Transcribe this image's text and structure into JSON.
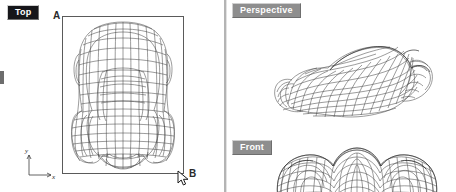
{
  "app": {
    "type": "3d-cad-viewport-layout",
    "background_color": "#ffffff"
  },
  "viewports": [
    {
      "id": "top",
      "label": "Top",
      "state": "active",
      "label_bg": "#16161a",
      "label_color": "#ffffff",
      "axes": [
        "y",
        "x"
      ],
      "corner_markers": [
        "A",
        "B"
      ],
      "model": "car-wireframe-top-plan"
    },
    {
      "id": "perspective",
      "label": "Perspective",
      "state": "inactive",
      "label_bg": "#8e8e8e",
      "label_color": "#ffffff",
      "axes": [
        "z",
        "y",
        "x"
      ],
      "model": "car-wireframe-perspective"
    },
    {
      "id": "front",
      "label": "Front",
      "state": "inactive",
      "label_bg": "#8e8e8e",
      "label_color": "#ffffff",
      "axes": [],
      "model": "car-wireframe-front-elevation"
    }
  ],
  "annotations": {
    "letter_a": "A",
    "letter_b": "B"
  },
  "gnomon_top": {
    "y_label": "y",
    "x_label": "x"
  },
  "gnomon_perspective": {
    "z_label": "z",
    "y_label": "y",
    "x_label": "x"
  },
  "cursor": {
    "name": "arrow-pointer",
    "x": 177,
    "y": 170
  },
  "colors": {
    "wire": "#4a4a4a",
    "frame": "#5a5a5a",
    "divider": "#b4b4b4"
  }
}
